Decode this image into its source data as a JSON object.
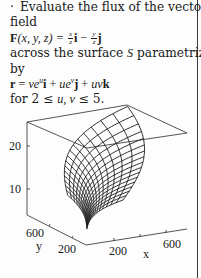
{
  "problem": {
    "bullet": "·",
    "line1": "Evaluate the flux of the vector",
    "line2": "field",
    "field_lhs": "F",
    "field_args": "(x, y, z) = ",
    "field_term1_num": "x",
    "field_term1_den": "z",
    "field_term1_vec": "i",
    "field_minus": " − ",
    "field_term2_num": "y",
    "field_term2_den": "z",
    "field_term2_vec": "j",
    "line4": "across the surface",
    "surface_symbol": "S",
    "line4_end": "parametrized",
    "line5": "by",
    "param_lhs": "r",
    "param_eq": " = ",
    "param_t1_coef": "ve",
    "param_t1_exp": "u",
    "param_t1_vec": "i",
    "param_plus1": " + ",
    "param_t2_coef": "ue",
    "param_t2_exp": "v",
    "param_t2_vec": "j",
    "param_plus2": " + ",
    "param_t3_coef": "uv",
    "param_t3_vec": "k",
    "range_prefix": "for 2 ≤ ",
    "range_vars": "u, v",
    "range_suffix": " ≤ 5."
  },
  "figure": {
    "type": "3d-surface-wireframe",
    "z_ticks": [
      "20",
      "10"
    ],
    "y_ticks": [
      "600",
      "200"
    ],
    "x_ticks": [
      "200",
      "600"
    ],
    "x_label": "x",
    "y_label": "y",
    "line_color": "#1a1a1a"
  }
}
